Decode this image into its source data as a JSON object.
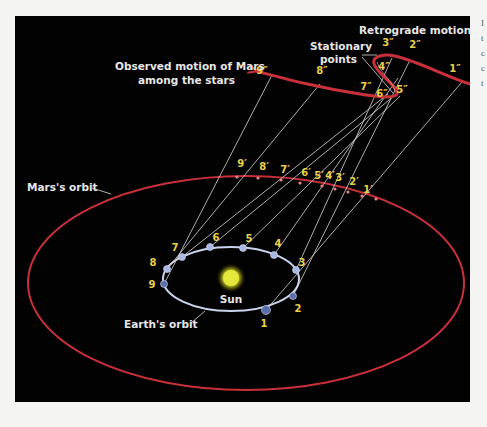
{
  "diagram": {
    "title_labels": {
      "retrograde": "Retrograde motion",
      "stationary_line1": "Stationary",
      "stationary_line2": "points",
      "observed_line1": "Observed motion of Mars",
      "observed_line2": "among the stars",
      "mars_orbit": "Mars's orbit",
      "earth_orbit": "Earth's orbit",
      "sun": "Sun"
    },
    "earth_positions": [
      "1",
      "2",
      "3",
      "4",
      "5",
      "6",
      "7",
      "8",
      "9"
    ],
    "mars_positions": [
      "1′",
      "2′",
      "3′",
      "4′",
      "5′",
      "6′",
      "7′",
      "8′",
      "9′"
    ],
    "sky_positions": [
      "1″",
      "2″",
      "3″",
      "4″",
      "5″",
      "6″",
      "7″",
      "8″",
      "9″"
    ],
    "colors": {
      "background": "#030203",
      "mars_orbit": "#c8303a",
      "earth_orbit": "#c9d3ec",
      "sun": "#e4e83a",
      "number_labels": "#e8d04a",
      "text_labels": "#e6e6e6",
      "sight_lines": "#d8d8d8"
    },
    "page_fragments": [
      "I",
      "t",
      "c",
      "c",
      "t"
    ]
  }
}
